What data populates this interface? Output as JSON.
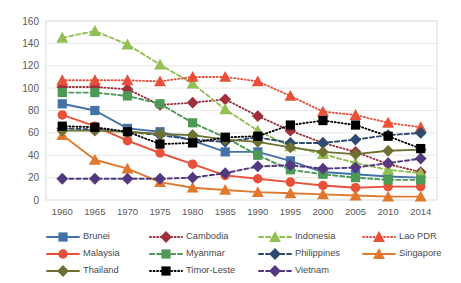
{
  "chart_data": {
    "type": "line",
    "title": "",
    "xlabel": "",
    "ylabel": "",
    "x": [
      1960,
      1965,
      1970,
      1975,
      1980,
      1985,
      1990,
      1995,
      2000,
      2005,
      2010,
      2014
    ],
    "xticklabels": [
      "1960",
      "1965",
      "1970",
      "1975",
      "1980",
      "1985",
      "1990",
      "1995",
      "2000",
      "2005",
      "2010",
      "2014"
    ],
    "yticklabels": [
      "0",
      "20",
      "40",
      "60",
      "80",
      "100",
      "120",
      "140",
      "160"
    ],
    "ylim": [
      0,
      160
    ],
    "ytick_step": 20,
    "grid": "horizontal",
    "legend_position": "bottom",
    "series": [
      {
        "name": "Brunei",
        "color": "#4472a8",
        "marker": "square",
        "dash": "solid",
        "values": [
          86,
          80,
          64,
          61,
          53,
          43,
          43,
          35,
          25,
          23,
          21,
          20
        ]
      },
      {
        "name": "Cambodia",
        "color": "#9e3039",
        "marker": "diamond",
        "dash": "dotted",
        "values": [
          101,
          101,
          99,
          85,
          87,
          90,
          75,
          62,
          51,
          43,
          32,
          25
        ]
      },
      {
        "name": "Indonesia",
        "color": "#93c055",
        "marker": "triangle",
        "dash": "dashed",
        "values": [
          145,
          151,
          139,
          121,
          104,
          81,
          62,
          48,
          41,
          33,
          27,
          24
        ]
      },
      {
        "name": "Lao PDR",
        "color": "#e8503a",
        "marker": "triangle",
        "dash": "dotted",
        "values": [
          107,
          107,
          107,
          106,
          110,
          110,
          106,
          93,
          79,
          76,
          69,
          65
        ]
      },
      {
        "name": "Malaysia",
        "color": "#e8503a",
        "marker": "circle",
        "dash": "solid",
        "values": [
          76,
          66,
          53,
          42,
          32,
          22,
          19,
          16,
          13,
          11,
          12,
          12
        ]
      },
      {
        "name": "Myanmar",
        "color": "#4d9a56",
        "marker": "square",
        "dash": "dashed",
        "values": [
          96,
          96,
          93,
          86,
          69,
          56,
          40,
          27,
          23,
          20,
          18,
          18
        ]
      },
      {
        "name": "Philippines",
        "color": "#2c4a72",
        "marker": "diamond",
        "dash": "dashed",
        "values": [
          64,
          63,
          61,
          58,
          54,
          52,
          56,
          51,
          51,
          54,
          58,
          60
        ]
      },
      {
        "name": "Singapore",
        "color": "#e0792e",
        "marker": "triangle",
        "dash": "solid",
        "values": [
          58,
          36,
          28,
          16,
          11,
          9,
          7,
          6,
          5,
          4,
          3,
          3
        ]
      },
      {
        "name": "Thailand",
        "color": "#6d7030",
        "marker": "diamond",
        "dash": "solid",
        "values": [
          62,
          62,
          61,
          59,
          58,
          54,
          52,
          47,
          43,
          41,
          44,
          45
        ]
      },
      {
        "name": "Timor-Leste",
        "color": "#000000",
        "marker": "square",
        "dash": "dotted",
        "values": [
          66,
          65,
          61,
          50,
          51,
          56,
          57,
          67,
          71,
          67,
          57,
          46
        ]
      },
      {
        "name": "Vietnam",
        "color": "#52387e",
        "marker": "diamond",
        "dash": "dashed",
        "values": [
          19,
          19,
          19,
          19,
          20,
          24,
          30,
          31,
          28,
          29,
          33,
          37
        ]
      }
    ]
  },
  "legend": {
    "items": [
      {
        "label": "Brunei"
      },
      {
        "label": "Cambodia"
      },
      {
        "label": "Indonesia"
      },
      {
        "label": "Lao PDR"
      },
      {
        "label": "Malaysia"
      },
      {
        "label": "Myanmar"
      },
      {
        "label": "Philippines"
      },
      {
        "label": "Singapore"
      },
      {
        "label": "Thailand"
      },
      {
        "label": "Timor-Leste"
      },
      {
        "label": "Vietnam"
      }
    ]
  }
}
